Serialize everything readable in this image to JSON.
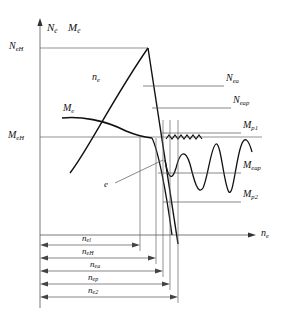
{
  "figure": {
    "kind": "engineering-characteristic-diagram",
    "background": "#ffffff",
    "line_color": "#111111",
    "thin_line_color": "#444444"
  },
  "axes": {
    "y_axis_label": "N",
    "y_axis_label_sub": "e",
    "y_axis_label_2": "M",
    "y_axis_label_2_sub": "e",
    "x_axis_label": "n",
    "x_axis_label_sub": "e",
    "y_ticks": [
      {
        "name": "N_eH",
        "base": "N",
        "sub": "eH",
        "y_px": 48
      },
      {
        "name": "M_eH",
        "base": "M",
        "sub": "eH",
        "y_px": 137
      }
    ],
    "origin_px": {
      "x": 40,
      "y": 235
    }
  },
  "curves": [
    {
      "name": "n_e",
      "base": "n",
      "sub": "e",
      "label_x": 92,
      "label_y": 78,
      "role": "power-rising-curve"
    },
    {
      "name": "M_e",
      "base": "M",
      "sub": "e",
      "label_x": 63,
      "label_y": 110,
      "role": "torque-curve"
    },
    {
      "name": "e",
      "base": "e",
      "sub": "",
      "label_x": 105,
      "label_y": 186,
      "role": "droop-point-callout"
    }
  ],
  "right_labels": [
    {
      "name": "N_ea",
      "base": "N",
      "sub": "ea",
      "x": 226,
      "y": 80,
      "leader_from_x": 143,
      "leader_y": 86
    },
    {
      "name": "N_eap",
      "base": "N",
      "sub": "eap",
      "x": 233,
      "y": 102,
      "leader_from_x": 155,
      "leader_y": 108
    },
    {
      "name": "M_p1",
      "base": "M",
      "sub": "p1",
      "x": 243,
      "y": 127,
      "leader_from_x": 160,
      "leader_y": 133
    },
    {
      "name": "M_eap",
      "base": "M",
      "sub": "eap",
      "x": 243,
      "y": 167,
      "leader_from_x": 158,
      "leader_y": 173
    },
    {
      "name": "M_p2",
      "base": "M",
      "sub": "p2",
      "x": 243,
      "y": 196,
      "leader_from_x": 163,
      "leader_y": 202
    }
  ],
  "dimensions": [
    {
      "name": "n_el",
      "base": "n",
      "sub": "el",
      "y_px": 245,
      "end_x": 140,
      "label_x": 86,
      "label_y": 237
    },
    {
      "name": "n_eH",
      "base": "n",
      "sub": "eH",
      "y_px": 258,
      "end_x": 156,
      "label_x": 86,
      "label_y": 250
    },
    {
      "name": "n_ea",
      "base": "n",
      "sub": "ea",
      "y_px": 271,
      "end_x": 163,
      "label_x": 94,
      "label_y": 263
    },
    {
      "name": "n_ep",
      "base": "n",
      "sub": "ep",
      "y_px": 284,
      "end_x": 170,
      "label_x": 90,
      "label_y": 276
    },
    {
      "name": "n_e2",
      "base": "n",
      "sub": "e2",
      "y_px": 297,
      "end_x": 178,
      "label_x": 90,
      "label_y": 289
    }
  ],
  "verticals": [
    {
      "name": "vline-nel",
      "x": 140
    },
    {
      "name": "vline-neH",
      "x": 156
    },
    {
      "name": "vline-nea",
      "x": 163
    },
    {
      "name": "vline-nep",
      "x": 170
    },
    {
      "name": "vline-ne2",
      "x": 178
    }
  ]
}
